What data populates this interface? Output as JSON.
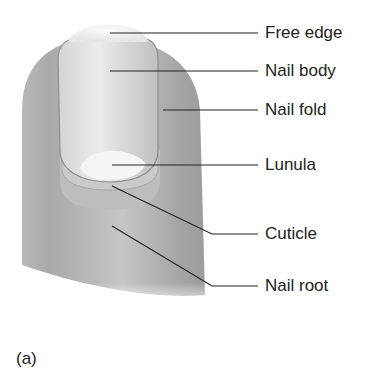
{
  "diagram": {
    "panel_label": "(a)",
    "labels": [
      {
        "text": "Free edge",
        "y": 33
      },
      {
        "text": "Nail body",
        "y": 71
      },
      {
        "text": "Nail fold",
        "y": 110
      },
      {
        "text": "Lunula",
        "y": 165
      },
      {
        "text": "Cuticle",
        "y": 234
      },
      {
        "text": "Nail root",
        "y": 286
      }
    ],
    "colors": {
      "skin_dark": "#a3a3a3",
      "skin_light": "#cfcfcf",
      "nail": "#e2e2e2",
      "lunula": "#f6f6f6",
      "leader_line": "#222222"
    }
  }
}
